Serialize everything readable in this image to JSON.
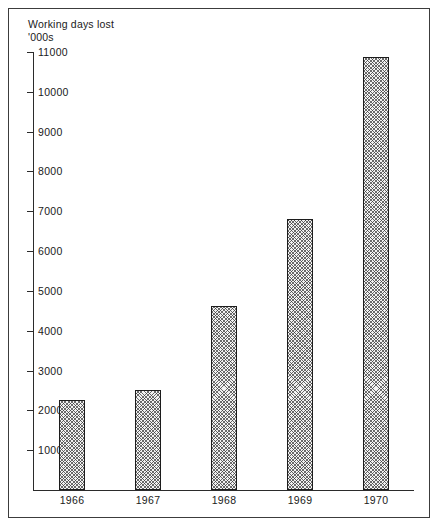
{
  "figure": {
    "frame_color": "#3c3c3c",
    "background": "#ffffff",
    "axis_color": "#2b2b2b",
    "bar_outline_color": "#1c1c1c",
    "bar_fill_color": "#f2f2f2",
    "bar_hatch": "cross-hatch"
  },
  "title": {
    "line1": "Working days lost",
    "line2": "'000s"
  },
  "chart_data": {
    "type": "bar",
    "title": "Working days lost",
    "subtitle": "'000s",
    "xlabel": "",
    "ylabel": "'000s",
    "categories": [
      "1966",
      "1967",
      "1968",
      "1969",
      "1970"
    ],
    "values": [
      2250,
      2500,
      4625,
      6800,
      10875
    ],
    "ylim": [
      0,
      11000
    ],
    "yticks": [
      1000,
      2000,
      3000,
      4000,
      5000,
      6000,
      7000,
      8000,
      9000,
      10000,
      11000
    ],
    "ytick_labels": [
      "1000",
      "2000",
      "3000",
      "4000",
      "5000",
      "6000",
      "7000",
      "8000",
      "9000",
      "10000",
      "11000"
    ],
    "grid": false,
    "legend": null,
    "legend_position": "none",
    "series": [
      {
        "name": "Working days lost ('000s)",
        "values": [
          2250,
          2500,
          4625,
          6800,
          10875
        ]
      }
    ]
  }
}
